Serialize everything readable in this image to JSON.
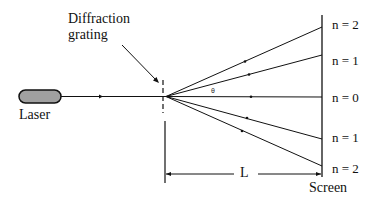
{
  "diagram": {
    "labels": {
      "grating": [
        "Diffraction",
        "grating"
      ],
      "laser": "Laser",
      "screen": "Screen",
      "distance": "L",
      "angle": "θ"
    },
    "orders": [
      {
        "label": "n = 2",
        "position": "top"
      },
      {
        "label": "n = 1",
        "position": "upper"
      },
      {
        "label": "n = 0",
        "position": "center"
      },
      {
        "label": "n = 1",
        "position": "lower"
      },
      {
        "label": "n = 2",
        "position": "bottom"
      }
    ],
    "colors": {
      "line": "#111111",
      "laser_fill": "#a0a0a0"
    }
  }
}
